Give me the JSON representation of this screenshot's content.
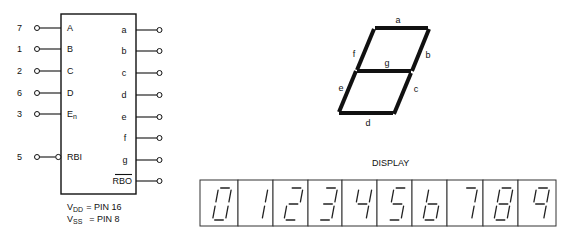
{
  "decoder": {
    "inputs": [
      {
        "pin": "7",
        "label": "A"
      },
      {
        "pin": "1",
        "label": "B"
      },
      {
        "pin": "2",
        "label": "C"
      },
      {
        "pin": "6",
        "label": "D"
      },
      {
        "pin": "3",
        "label": "En",
        "label_main": "E",
        "label_sub": "n"
      },
      {
        "pin": "5",
        "label": "RBI",
        "inverted": true
      }
    ],
    "outputs": [
      "a",
      "b",
      "c",
      "d",
      "e",
      "f",
      "g",
      "RBO"
    ],
    "power": {
      "vdd_main": "V",
      "vdd_sub": "DD",
      "vdd_value": "= PIN 16",
      "vss_main": "V",
      "vss_sub": "SS",
      "vss_value": "= PIN 8"
    }
  },
  "segment_diagram": {
    "labels": {
      "a": "a",
      "b": "b",
      "c": "c",
      "d": "d",
      "e": "e",
      "f": "f",
      "g": "g"
    }
  },
  "display": {
    "title": "DISPLAY",
    "digits": [
      "0",
      "1",
      "2",
      "3",
      "4",
      "5",
      "6",
      "7",
      "8",
      "9"
    ]
  }
}
